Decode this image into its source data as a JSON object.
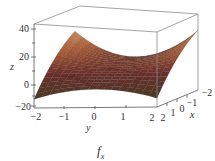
{
  "chart_data": {
    "type": "surface3d",
    "title": "",
    "caption": {
      "main": "f",
      "sub": "x"
    },
    "xlabel": "x",
    "ylabel": "y",
    "zlabel": "z",
    "x_ticks": [
      "2",
      "1",
      "0",
      "−1",
      "−2"
    ],
    "y_ticks": [
      "−2",
      "−1",
      "0",
      "1",
      "2"
    ],
    "z_ticks": [
      "40",
      "20",
      "0",
      "−20"
    ],
    "xlim": [
      -2,
      2
    ],
    "ylim": [
      -2,
      2
    ],
    "zlim": [
      -20,
      40
    ],
    "grid": false,
    "box": true,
    "colormap": {
      "low": "#3a3f22",
      "mid_dark": "#6b2d2a",
      "mid": "#b5633c",
      "high": "#e9dfae"
    },
    "surface_description": "Saddle-shaped partial derivative surface; peaks near z≈40 at the back-left and back-right corners, dips to z≈−20 at the front-left and front-right corners."
  }
}
